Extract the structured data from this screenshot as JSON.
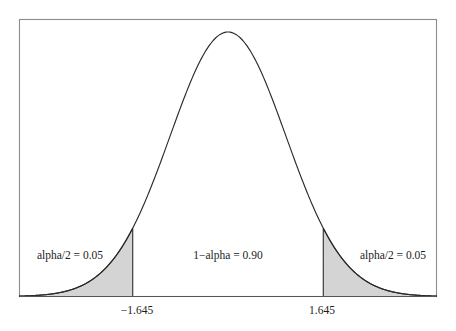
{
  "figure": {
    "background_color": "#ffffff",
    "frame_color": "#8c8c8c",
    "curve_color": "#2b2b2b",
    "shade_color": "#d4d4d4",
    "text_color": "#1c1c1c"
  },
  "chart_data": {
    "type": "area",
    "title": "",
    "subtitle": "",
    "xlabel": "",
    "ylabel": "",
    "distribution": "standard normal",
    "mean": 0,
    "sd": 1,
    "grid": false,
    "legend": false,
    "xlim": [
      -3.6,
      3.6
    ],
    "ylim": [
      0,
      0.42
    ],
    "tick_labels": [
      "−1.645",
      "1.645"
    ],
    "tick_values": [
      -1.645,
      1.645
    ],
    "annotations": [
      {
        "text": "alpha/2 = 0.05",
        "x": -2.55,
        "y": 0.075,
        "region": "left-tail"
      },
      {
        "text": "1−alpha = 0.90",
        "x": 0.0,
        "y": 0.075,
        "region": "center"
      },
      {
        "text": "alpha/2 = 0.05",
        "x": 2.55,
        "y": 0.075,
        "region": "right-tail"
      }
    ],
    "shaded_regions": [
      {
        "name": "left-tail",
        "from": -3.6,
        "to": -1.645,
        "area": 0.05,
        "label": "alpha/2 = 0.05"
      },
      {
        "name": "right-tail",
        "from": 1.645,
        "to": 3.6,
        "area": 0.05,
        "label": "alpha/2 = 0.05"
      }
    ],
    "unshaded_region": {
      "name": "center",
      "from": -1.645,
      "to": 1.645,
      "area": 0.9,
      "label": "1−alpha = 0.90"
    },
    "x": [
      -3.6,
      -3.4,
      -3.2,
      -3.0,
      -2.8,
      -2.6,
      -2.4,
      -2.2,
      -2.0,
      -1.8,
      -1.645,
      -1.6,
      -1.4,
      -1.2,
      -1.0,
      -0.8,
      -0.6,
      -0.4,
      -0.2,
      0.0,
      0.2,
      0.4,
      0.6,
      0.8,
      1.0,
      1.2,
      1.4,
      1.6,
      1.645,
      1.8,
      2.0,
      2.2,
      2.4,
      2.6,
      2.8,
      3.0,
      3.2,
      3.4,
      3.6
    ],
    "y": [
      0.0006,
      0.0012,
      0.0024,
      0.0044,
      0.0079,
      0.0136,
      0.0224,
      0.0355,
      0.054,
      0.079,
      0.1031,
      0.1109,
      0.1497,
      0.1942,
      0.242,
      0.2897,
      0.3332,
      0.3683,
      0.391,
      0.3989,
      0.391,
      0.3683,
      0.3332,
      0.2897,
      0.242,
      0.1942,
      0.1497,
      0.1109,
      0.1031,
      0.079,
      0.054,
      0.0355,
      0.0224,
      0.0136,
      0.0079,
      0.0044,
      0.0024,
      0.0012,
      0.0006
    ]
  },
  "labels": {
    "left_tail": "alpha/2 = 0.05",
    "center": "1−alpha = 0.90",
    "right_tail": "alpha/2 = 0.05",
    "tick_left": "−1.645",
    "tick_right": "1.645"
  }
}
